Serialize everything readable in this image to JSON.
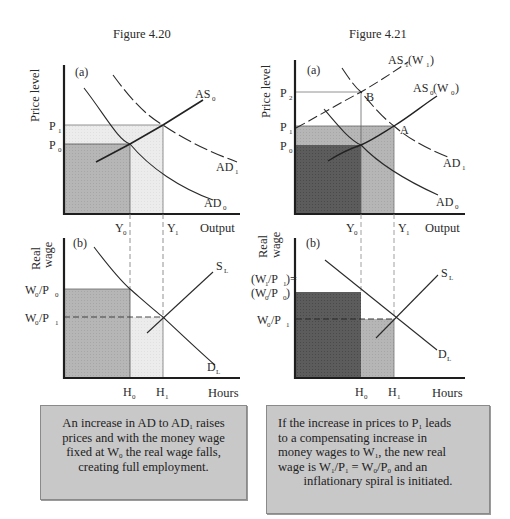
{
  "figures": [
    {
      "id": "fig-4-20",
      "title": "Figure 4.20",
      "panel_a": {
        "label": "(a)",
        "y_axis_title": "Price level",
        "x_axis_title": "Output",
        "y_ticks": [
          {
            "main": "P",
            "sub": "1"
          },
          {
            "main": "P",
            "sub": "0"
          }
        ],
        "x_ticks": [
          {
            "main": "Y",
            "sub": "0"
          },
          {
            "main": "Y",
            "sub": "1"
          }
        ],
        "curves": [
          {
            "main": "AS",
            "sub": "0",
            "style": "solid"
          },
          {
            "main": "AD",
            "sub": "1",
            "style": "dashed"
          },
          {
            "main": "AD",
            "sub": "0",
            "style": "solid"
          }
        ]
      },
      "panel_b": {
        "label": "(b)",
        "y_axis_title_line1": "Real",
        "y_axis_title_line2": "wage",
        "x_axis_title": "Hours",
        "y_ticks": [
          {
            "main": "W",
            "sub": "0",
            "main2": "/P",
            "sub2": "0"
          },
          {
            "main": "W",
            "sub": "0",
            "main2": "/P",
            "sub2": "1"
          }
        ],
        "x_ticks": [
          {
            "main": "H",
            "sub": "0"
          },
          {
            "main": "H",
            "sub": "1"
          }
        ],
        "curves": [
          {
            "main": "S",
            "sub": "L"
          },
          {
            "main": "D",
            "sub": "L"
          }
        ]
      },
      "caption_lines": [
        [
          "An increase in AD to AD",
          "1",
          " raises"
        ],
        [
          "prices and with the money wage"
        ],
        [
          "fixed at W",
          "0",
          " the real wage falls,"
        ],
        [
          "creating full employment."
        ]
      ]
    },
    {
      "id": "fig-4-21",
      "title": "Figure 4.21",
      "panel_a": {
        "label": "(a)",
        "y_axis_title": "Price level",
        "x_axis_title": "Output",
        "y_ticks": [
          {
            "main": "P",
            "sub": "2"
          },
          {
            "main": "P",
            "sub": "1"
          },
          {
            "main": "P",
            "sub": "0"
          }
        ],
        "x_ticks": [
          {
            "main": "Y",
            "sub": "0"
          },
          {
            "main": "Y",
            "sub": "1"
          }
        ],
        "curves": [
          {
            "main": "AS",
            "sub": "1",
            "suffix_main": " (W",
            "suffix_sub": "1",
            "suffix_end": ")",
            "style": "dashed"
          },
          {
            "main": "AS",
            "sub": "0",
            "suffix_main": " (W",
            "suffix_sub": "0",
            "suffix_end": ")",
            "style": "solid"
          },
          {
            "main": "AD",
            "sub": "1",
            "style": "dashed"
          },
          {
            "main": "AD",
            "sub": "0",
            "style": "solid"
          }
        ],
        "points": [
          "B",
          "A"
        ]
      },
      "panel_b": {
        "label": "(b)",
        "y_axis_title_line1": "Real",
        "y_axis_title_line2": "wage",
        "x_axis_title": "Hours",
        "y_ticks": [
          {
            "line1_main": "(W",
            "line1_sub": "1",
            "line1_mid": "/P",
            "line1_sub2": "1",
            "line1_end": ")=",
            "line2_main": "(W",
            "line2_sub": "0",
            "line2_mid": "/P",
            "line2_sub2": "0",
            "line2_end": ")"
          },
          {
            "main": "W",
            "sub": "0",
            "main2": "/P",
            "sub2": "1"
          }
        ],
        "x_ticks": [
          {
            "main": "H",
            "sub": "0"
          },
          {
            "main": "H",
            "sub": "1"
          }
        ],
        "curves": [
          {
            "main": "S",
            "sub": "L"
          },
          {
            "main": "D",
            "sub": "L"
          }
        ]
      },
      "caption_lines": [
        [
          "If the increase in prices to P",
          "1",
          " leads"
        ],
        [
          "to a compensating increase in"
        ],
        [
          "money wages to W",
          "1",
          ", the new real"
        ],
        [
          "wage is W",
          "1",
          "/P",
          "1",
          " = W",
          "0",
          "/P",
          "0",
          " and an"
        ],
        [
          "inflationary spiral is initiated."
        ]
      ]
    }
  ],
  "colors": {
    "axis": "#1e1e1e",
    "curve": "#2a2a2a",
    "guide": "#6a6a6a",
    "shade_light": "#e6e6e6",
    "shade_mid": "#b4b4b4",
    "shade_dark": "#5a5a5a",
    "caption_bg": "#c8c8c8"
  }
}
